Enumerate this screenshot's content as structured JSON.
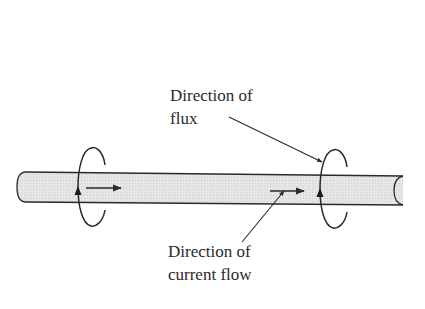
{
  "diagram": {
    "title": "",
    "colors": {
      "background": "#ffffff",
      "rod_fill": "#e2e2e2",
      "stroke": "#2a2a2a",
      "text": "#2a2a2a"
    },
    "labels": {
      "flux": {
        "line1": "Direction of",
        "line2": "flux"
      },
      "current": {
        "line1": "Direction of",
        "line2": "current flow"
      }
    },
    "elements": [
      {
        "id": "conductor-rod",
        "type": "cylinder",
        "description": "horizontal conductor rod"
      },
      {
        "id": "flux-loop-left",
        "type": "circular-arrow",
        "direction": "counterclockwise (arrow up on front)"
      },
      {
        "id": "flux-loop-right",
        "type": "circular-arrow",
        "direction": "counterclockwise (arrow up on front)"
      },
      {
        "id": "current-arrow-left",
        "type": "arrow",
        "direction": "right"
      },
      {
        "id": "current-arrow-right",
        "type": "arrow",
        "direction": "right"
      },
      {
        "id": "flux-leader-line",
        "type": "pointer",
        "from": "flux label",
        "to": "right flux loop"
      },
      {
        "id": "current-leader-line",
        "type": "pointer",
        "from": "current label",
        "to": "right current arrow"
      }
    ]
  }
}
